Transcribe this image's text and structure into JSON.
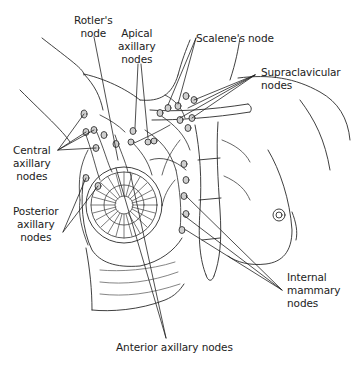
{
  "figure": {
    "colors": {
      "line": "#2a2a2a",
      "shade": "#9a9a9a",
      "background": "#ffffff"
    }
  },
  "labels": {
    "rotters_node": "Rotler's\nnode",
    "apical_axillary": "Apical\naxillary\nnodes",
    "scalenes_node": "Scalene's node",
    "supraclavicular": "Supraclavicular\nnodes",
    "central_axillary": "Central\naxillary\nnodes",
    "posterior_axillary": "Posterior\naxillary\nnodes",
    "internal_mammary": "Internal\nmammary\nnodes",
    "anterior_axillary": "Anterior axillary nodes"
  }
}
